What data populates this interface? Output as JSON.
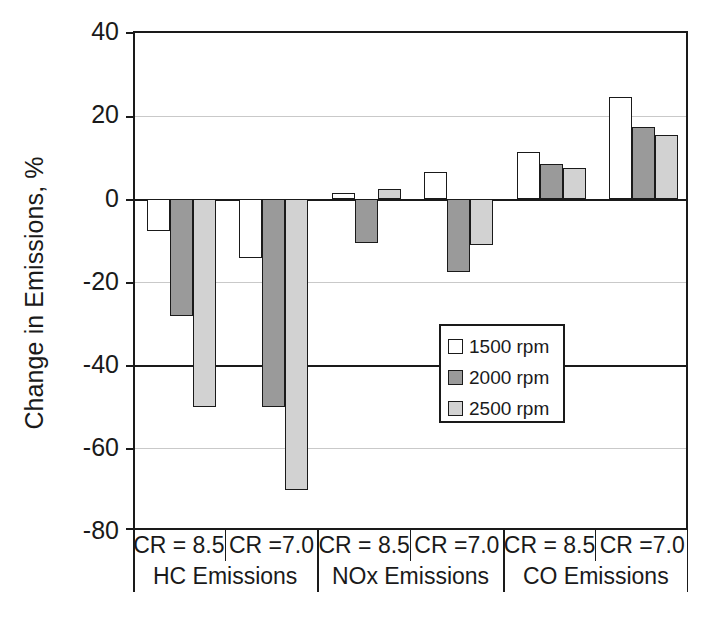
{
  "chart_data": {
    "type": "bar",
    "title": "",
    "xlabel": "",
    "ylabel": "Change in Emissions, %",
    "ylim": [
      -80,
      40
    ],
    "yticks": [
      40,
      20,
      0,
      -20,
      -40,
      -60,
      -80
    ],
    "ytick_labels": [
      "40",
      "20",
      "0",
      "-20",
      "-40",
      "-60",
      "-80"
    ],
    "grid": true,
    "legend_position": "center",
    "categories": [
      "HC Emissions / CR = 8.5",
      "HC Emissions / CR =7.0",
      "NOx Emissions / CR = 8.5",
      "NOx Emissions / CR =7.0",
      "CO Emissions / CR = 8.5",
      "CO Emissions / CR =7.0"
    ],
    "series": [
      {
        "name": "1500 rpm",
        "color": "#ffffff",
        "values": [
          -7.5,
          -14,
          1.5,
          6.5,
          11.5,
          24.5
        ]
      },
      {
        "name": "2000 rpm",
        "color": "#9a9a9a",
        "values": [
          -28,
          -50,
          -10.5,
          -17.5,
          8.5,
          17.5
        ]
      },
      {
        "name": "2500 rpm",
        "color": "#d2d2d2",
        "values": [
          -50,
          -70,
          2.5,
          -11,
          7.5,
          15.5
        ]
      }
    ],
    "groups": [
      {
        "label": "HC Emissions",
        "cr_labels": [
          "CR = 8.5",
          "CR =7.0"
        ]
      },
      {
        "label": "NOx Emissions",
        "cr_labels": [
          "CR = 8.5",
          "CR =7.0"
        ]
      },
      {
        "label": "CO Emissions",
        "cr_labels": [
          "CR = 8.5",
          "CR =7.0"
        ]
      }
    ],
    "cr_cells": [
      "CR = 8.5",
      "CR =7.0",
      "CR = 8.5",
      "CR =7.0",
      "CR = 8.5",
      "CR =7.0"
    ],
    "group_cells": [
      "HC Emissions",
      "NOx Emissions",
      "CO Emissions"
    ]
  },
  "legend": {
    "items": [
      {
        "label": "1500 rpm",
        "swatch": "white-swatch"
      },
      {
        "label": "2000 rpm",
        "swatch": "dark-gray-swatch"
      },
      {
        "label": "2500 rpm",
        "swatch": "light-gray-swatch"
      }
    ]
  },
  "axis": {
    "y_title": "Change in Emissions, %",
    "y_tick_0": "40",
    "y_tick_1": "20",
    "y_tick_2": "0",
    "y_tick_3": "-20",
    "y_tick_4": "-40",
    "y_tick_5": "-60",
    "y_tick_6": "-80"
  },
  "colors": {
    "axis": "#1a1a1a",
    "grid": "#c9c9c9",
    "series_1500": "#ffffff",
    "series_2000": "#9a9a9a",
    "series_2500": "#d2d2d2"
  }
}
